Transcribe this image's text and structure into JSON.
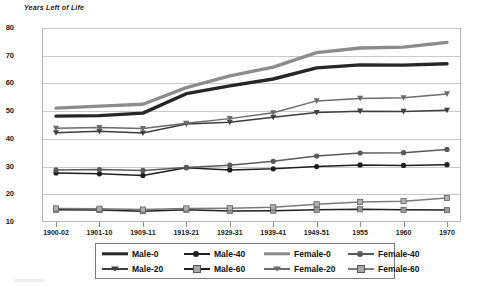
{
  "chart_data": {
    "type": "line",
    "title": "Years Left of Life",
    "xlabel": "",
    "ylabel": "Years Left of Life",
    "ylim": [
      10,
      80
    ],
    "ytick_step": 10,
    "yticks": [
      10,
      20,
      30,
      40,
      50,
      60,
      70,
      80
    ],
    "grid": true,
    "legend_position": "bottom",
    "categories": [
      "1900-02",
      "1901-10",
      "1909-11",
      "1919-21",
      "1929-31",
      "1939-41",
      "1949-51",
      "1955",
      "1960",
      "1970"
    ],
    "series": [
      {
        "name": "Male-0",
        "color": "#262626",
        "marker": "none",
        "width": 3.4,
        "values": [
          48.2,
          48.4,
          49.3,
          56.3,
          59.1,
          61.6,
          65.6,
          66.7,
          66.6,
          67.1
        ]
      },
      {
        "name": "Female-0",
        "color": "#8c8c8c",
        "marker": "none",
        "width": 3.4,
        "values": [
          51.1,
          51.8,
          52.5,
          58.5,
          62.7,
          65.9,
          71.1,
          72.8,
          73.1,
          74.8
        ]
      },
      {
        "name": "Male-20",
        "color": "#3d3d3d",
        "marker": "triangle",
        "width": 1.5,
        "values": [
          42.2,
          42.7,
          42.1,
          45.4,
          46.0,
          47.8,
          49.5,
          50.0,
          49.9,
          50.3
        ]
      },
      {
        "name": "Female-20",
        "color": "#6b6b6b",
        "marker": "triangle",
        "width": 1.5,
        "values": [
          43.8,
          44.1,
          43.7,
          45.6,
          47.3,
          49.4,
          53.7,
          54.6,
          54.8,
          56.2
        ]
      },
      {
        "name": "Male-40",
        "color": "#1f1f1f",
        "marker": "circle",
        "width": 1.5,
        "values": [
          27.7,
          27.4,
          26.8,
          29.6,
          28.8,
          29.2,
          30.0,
          30.6,
          30.4,
          30.7
        ]
      },
      {
        "name": "Female-40",
        "color": "#595959",
        "marker": "circle",
        "width": 1.5,
        "values": [
          28.8,
          28.9,
          28.6,
          29.7,
          30.5,
          31.9,
          33.8,
          34.9,
          35.0,
          36.2
        ]
      },
      {
        "name": "Male-60",
        "color": "#1f1f1f",
        "marker": "square",
        "width": 1.5,
        "values": [
          14.4,
          14.3,
          13.9,
          14.4,
          14.0,
          14.1,
          14.4,
          14.6,
          14.4,
          14.3
        ]
      },
      {
        "name": "Female-60",
        "color": "#7a7a7a",
        "marker": "square",
        "width": 1.5,
        "values": [
          14.9,
          14.8,
          14.5,
          14.9,
          15.0,
          15.3,
          16.4,
          17.2,
          17.5,
          18.7
        ]
      }
    ]
  },
  "legend": {
    "row1": [
      "Male-0",
      "Male-40",
      "Female-0",
      "Female-40"
    ],
    "row2": [
      "Male-20",
      "Male-60",
      "Female-20",
      "Female-60"
    ]
  },
  "colors": {
    "grid": "#c9c9c9",
    "frame": "#b6b6b6",
    "text": "#1a1a1a",
    "background": "#ffffff"
  }
}
